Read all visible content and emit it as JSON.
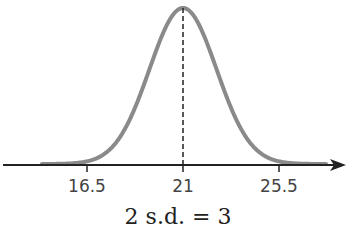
{
  "chart_data": {
    "type": "line",
    "title": "",
    "subtitle": "",
    "xlabel": "",
    "ylabel": "",
    "mean": 21,
    "std_dev": 1.5,
    "x_ticks": [
      16.5,
      21,
      25.5
    ],
    "x_tick_labels": [
      "16.5",
      "21",
      "25.5"
    ],
    "xlim": [
      13,
      28
    ],
    "grid": false,
    "legend": null,
    "annotations": [
      "2 s.d. = 3"
    ],
    "mean_line": {
      "x": 21,
      "style": "dashed"
    },
    "curve_color": "#888888",
    "axis_color": "#222222"
  },
  "caption": "2 s.d. = 3",
  "ticks": [
    {
      "label": "16.5",
      "px": 87
    },
    {
      "label": "21",
      "px": 183
    },
    {
      "label": "25.5",
      "px": 279
    }
  ]
}
